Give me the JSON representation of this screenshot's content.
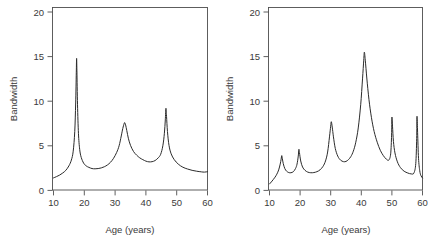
{
  "figure": {
    "title_fragment": "",
    "background": "#ffffff",
    "line_color": "#2b2b2b",
    "axis_color": "#4d4d4d"
  },
  "chart_data": [
    {
      "type": "line",
      "panel": "left",
      "title": "",
      "xlabel": "Age (years)",
      "ylabel": "Bandwidth",
      "xlim": [
        10,
        60
      ],
      "ylim": [
        0,
        20
      ],
      "xticks": [
        10,
        20,
        30,
        40,
        50,
        60
      ],
      "yticks": [
        0,
        5,
        10,
        15,
        20
      ],
      "xticklabels": [
        "10",
        "20",
        "30",
        "40",
        "50",
        "60"
      ],
      "yticklabels": [
        "0",
        "5",
        "10",
        "15",
        "20"
      ],
      "grid": false,
      "legend": "none",
      "peaks": [
        {
          "x": 17.5,
          "y": 14.8
        },
        {
          "x": 33.0,
          "y": 7.6
        },
        {
          "x": 46.5,
          "y": 9.2
        }
      ],
      "x": [
        10.0,
        11.0,
        12.0,
        13.0,
        14.0,
        15.0,
        15.8,
        16.4,
        16.9,
        17.2,
        17.4,
        17.5,
        17.6,
        17.8,
        18.1,
        18.5,
        19.0,
        19.8,
        20.6,
        21.5,
        22.5,
        23.5,
        24.5,
        25.5,
        26.5,
        27.5,
        28.5,
        29.5,
        30.5,
        31.3,
        32.0,
        32.5,
        32.9,
        33.1,
        33.4,
        33.8,
        34.3,
        35.0,
        36.0,
        37.0,
        38.0,
        39.0,
        40.0,
        41.0,
        42.0,
        43.0,
        44.0,
        44.8,
        45.5,
        46.0,
        46.3,
        46.5,
        46.7,
        47.0,
        47.5,
        48.2,
        49.2,
        50.5,
        52.0,
        53.5,
        55.0,
        56.5,
        58.0,
        59.0,
        60.0
      ],
      "y": [
        1.4,
        1.55,
        1.72,
        1.95,
        2.25,
        2.75,
        3.4,
        4.4,
        6.6,
        9.8,
        13.2,
        14.8,
        13.4,
        9.6,
        6.4,
        4.6,
        3.7,
        3.05,
        2.75,
        2.58,
        2.45,
        2.42,
        2.45,
        2.52,
        2.65,
        2.85,
        3.15,
        3.6,
        4.25,
        5.0,
        6.1,
        6.95,
        7.45,
        7.6,
        7.35,
        6.7,
        5.85,
        5.05,
        4.35,
        3.95,
        3.65,
        3.45,
        3.28,
        3.2,
        3.22,
        3.35,
        3.65,
        4.05,
        5.0,
        6.4,
        7.9,
        9.2,
        8.3,
        6.6,
        5.05,
        4.1,
        3.45,
        2.95,
        2.6,
        2.4,
        2.25,
        2.15,
        2.08,
        2.05,
        2.1
      ]
    },
    {
      "type": "line",
      "panel": "right",
      "title": "",
      "xlabel": "Age (years)",
      "ylabel": "Bandwidth",
      "xlim": [
        10,
        60
      ],
      "ylim": [
        0,
        20
      ],
      "xticks": [
        10,
        20,
        30,
        40,
        50,
        60
      ],
      "yticks": [
        0,
        5,
        10,
        15,
        20
      ],
      "xticklabels": [
        "10",
        "20",
        "30",
        "40",
        "50",
        "60"
      ],
      "yticklabels": [
        "0",
        "5",
        "10",
        "15",
        "20"
      ],
      "grid": false,
      "legend": "none",
      "peaks": [
        {
          "x": 14.0,
          "y": 3.9
        },
        {
          "x": 19.6,
          "y": 4.6
        },
        {
          "x": 30.2,
          "y": 7.7
        },
        {
          "x": 41.0,
          "y": 15.5
        },
        {
          "x": 50.0,
          "y": 8.2
        },
        {
          "x": 58.2,
          "y": 8.3
        }
      ],
      "x": [
        10.0,
        10.6,
        11.2,
        11.8,
        12.4,
        13.0,
        13.5,
        13.8,
        14.0,
        14.2,
        14.5,
        15.0,
        15.6,
        16.3,
        17.0,
        17.8,
        18.5,
        19.0,
        19.4,
        19.6,
        19.8,
        20.2,
        20.8,
        21.6,
        22.5,
        23.5,
        24.5,
        25.5,
        26.5,
        27.5,
        28.3,
        29.0,
        29.6,
        30.0,
        30.2,
        30.5,
        30.9,
        31.5,
        32.3,
        33.2,
        34.2,
        35.0,
        35.8,
        36.6,
        37.4,
        38.2,
        39.0,
        39.8,
        40.4,
        40.8,
        41.0,
        41.3,
        41.8,
        42.5,
        43.3,
        44.2,
        45.2,
        46.2,
        47.2,
        48.2,
        49.0,
        49.6,
        49.9,
        50.0,
        50.2,
        50.5,
        51.0,
        51.8,
        52.8,
        54.0,
        55.2,
        56.3,
        57.2,
        57.8,
        58.1,
        58.2,
        58.4,
        58.7,
        59.1,
        59.5,
        60.0
      ],
      "y": [
        0.72,
        0.95,
        1.2,
        1.48,
        1.82,
        2.3,
        2.95,
        3.5,
        3.9,
        3.55,
        3.0,
        2.45,
        2.15,
        2.0,
        1.98,
        2.1,
        2.45,
        2.95,
        3.85,
        4.6,
        4.2,
        3.3,
        2.62,
        2.25,
        2.05,
        1.98,
        2.0,
        2.1,
        2.3,
        2.7,
        3.3,
        4.3,
        6.0,
        7.2,
        7.7,
        7.1,
        6.0,
        4.7,
        3.85,
        3.4,
        3.22,
        3.25,
        3.45,
        3.8,
        4.4,
        5.4,
        7.0,
        9.6,
        12.5,
        14.6,
        15.5,
        14.6,
        12.6,
        10.2,
        8.2,
        6.6,
        5.4,
        4.5,
        3.9,
        3.5,
        3.4,
        4.1,
        6.2,
        8.2,
        7.2,
        5.5,
        4.2,
        3.2,
        2.55,
        2.15,
        1.95,
        1.85,
        1.95,
        3.0,
        5.8,
        8.3,
        6.5,
        3.6,
        2.2,
        1.65,
        1.4
      ]
    }
  ]
}
